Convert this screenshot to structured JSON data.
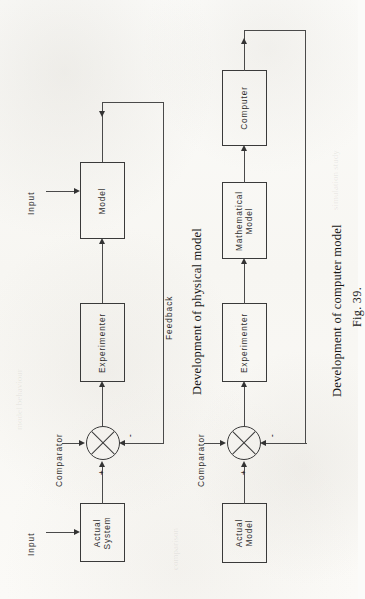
{
  "figure": {
    "number": "Fig. 39.",
    "caption_physical": "Development of physical model",
    "caption_computer": "Development of computer model"
  },
  "diagram_physical": {
    "name": "Development of physical model",
    "input_label": "Input",
    "comparator_label": "Comparator",
    "feedback_label": "Feedback",
    "plus_sign": "+",
    "minus_sign": "-",
    "blocks": [
      {
        "id": "actual-system",
        "label": "Actual\nSystem",
        "line1": "Actual",
        "line2": "System"
      },
      {
        "id": "experimenter",
        "label": "Experimenter",
        "line1": "Experimenter",
        "line2": ""
      },
      {
        "id": "model",
        "label": "Model",
        "line1": "Model",
        "line2": ""
      }
    ],
    "model_input_label": "Input"
  },
  "diagram_computer": {
    "name": "Development of computer model",
    "comparator_label": "Comparator",
    "plus_sign": "+",
    "minus_sign": "-",
    "blocks": [
      {
        "id": "actual-model",
        "label": "Actual\nModel",
        "line1": "Actual",
        "line2": "Model"
      },
      {
        "id": "experimenter",
        "label": "Experimenter",
        "line1": "Experimenter",
        "line2": ""
      },
      {
        "id": "mathematical-model",
        "label": "Mathematical\nModel",
        "line1": "Mathematical",
        "line2": "Model"
      },
      {
        "id": "computer",
        "label": "Computer",
        "line1": "Computer",
        "line2": ""
      }
    ]
  },
  "colors": {
    "paper": "#fbfbf9",
    "ink": "#2e2e2e",
    "line": "#4a4a4a"
  }
}
